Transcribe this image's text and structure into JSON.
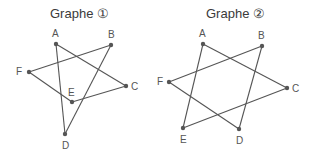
{
  "graphs": [
    {
      "title": "Graphe ①",
      "nodes": [
        {
          "id": "A",
          "x": 56,
          "y": 44,
          "lx": 52,
          "ly": 37
        },
        {
          "id": "B",
          "x": 111,
          "y": 45,
          "lx": 108,
          "ly": 38
        },
        {
          "id": "C",
          "x": 126,
          "y": 86,
          "lx": 131,
          "ly": 90
        },
        {
          "id": "D",
          "x": 65,
          "y": 134,
          "lx": 62,
          "ly": 149
        },
        {
          "id": "E",
          "x": 72,
          "y": 102,
          "lx": 68,
          "ly": 96
        },
        {
          "id": "F",
          "x": 29,
          "y": 72,
          "lx": 16,
          "ly": 75
        }
      ],
      "edges": [
        [
          "A",
          "C"
        ],
        [
          "A",
          "D"
        ],
        [
          "B",
          "F"
        ],
        [
          "B",
          "D"
        ],
        [
          "F",
          "E"
        ],
        [
          "E",
          "C"
        ]
      ]
    },
    {
      "title": "Graphe ②",
      "nodes": [
        {
          "id": "A",
          "x": 203,
          "y": 44,
          "lx": 199,
          "ly": 37
        },
        {
          "id": "B",
          "x": 262,
          "y": 46,
          "lx": 258,
          "ly": 39
        },
        {
          "id": "C",
          "x": 287,
          "y": 88,
          "lx": 292,
          "ly": 92
        },
        {
          "id": "D",
          "x": 239,
          "y": 129,
          "lx": 236,
          "ly": 144
        },
        {
          "id": "E",
          "x": 183,
          "y": 128,
          "lx": 180,
          "ly": 143
        },
        {
          "id": "F",
          "x": 169,
          "y": 82,
          "lx": 157,
          "ly": 85
        }
      ],
      "edges": [
        [
          "A",
          "C"
        ],
        [
          "A",
          "E"
        ],
        [
          "B",
          "F"
        ],
        [
          "B",
          "D"
        ],
        [
          "F",
          "D"
        ],
        [
          "E",
          "C"
        ]
      ]
    }
  ],
  "colors": {
    "edge": "#555555",
    "node": "#555555",
    "text": "#3a3a3a"
  }
}
